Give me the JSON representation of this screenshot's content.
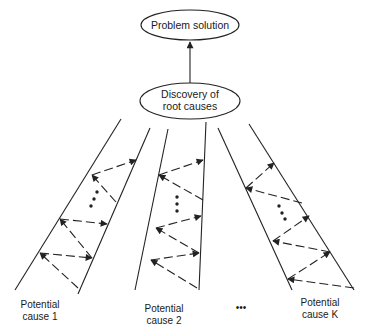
{
  "diagram": {
    "type": "root-cause flow",
    "nodes": {
      "top": {
        "label": "Problem solution"
      },
      "middle": {
        "line1": "Discovery of",
        "line2": "root causes"
      }
    },
    "lanes": [
      {
        "line1": "Potential",
        "line2": "cause 1"
      },
      {
        "line1": "Potential",
        "line2": "cause 2"
      },
      {
        "line1": "Potential",
        "line2": "cause K"
      }
    ],
    "ellipsis_between_lanes": "•••",
    "colors": {
      "stroke": "#222222",
      "background": "#ffffff"
    }
  }
}
